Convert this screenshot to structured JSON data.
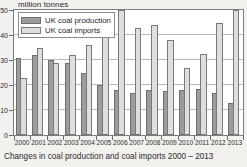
{
  "unit_label": "million tonnes",
  "caption": "Changes in coal production and coal imports 2000 – 2013",
  "legend": {
    "items": [
      {
        "label": "UK coal production",
        "color": "#9c9c9c"
      },
      {
        "label": "UK coal imports",
        "color": "#dededc"
      }
    ]
  },
  "chart_data": {
    "type": "bar",
    "title": "Changes in coal production and coal imports 2000 – 2013",
    "xlabel": "",
    "ylabel": "million tonnes",
    "ylim": [
      0,
      50
    ],
    "yticks": [
      0,
      10,
      20,
      30,
      40,
      50
    ],
    "ytick_labels": [
      "0",
      "10",
      "20",
      "30",
      "40",
      "50"
    ],
    "grid": true,
    "legend_position": "top-left",
    "categories": [
      "2000",
      "2001",
      "2002",
      "2003",
      "2004",
      "2005",
      "2006",
      "2007",
      "2008",
      "2009",
      "2010",
      "2011",
      "2012",
      "2013"
    ],
    "series": [
      {
        "name": "UK coal production",
        "color": "#9c9c9c",
        "values": [
          31,
          32,
          30,
          29,
          25,
          20,
          18,
          17,
          18,
          17.5,
          18,
          18.5,
          17,
          13
        ]
      },
      {
        "name": "UK coal imports",
        "color": "#dededc",
        "values": [
          23,
          35,
          29,
          32,
          36,
          44,
          50,
          43,
          44,
          38,
          27,
          32.5,
          45,
          50
        ]
      }
    ]
  }
}
